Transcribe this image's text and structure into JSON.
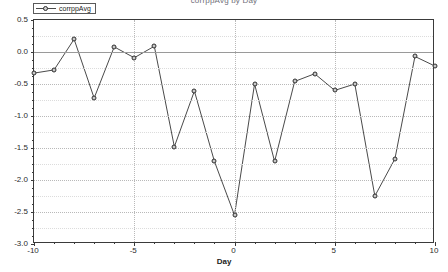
{
  "chart_data": {
    "type": "line",
    "title": "corrppAvg by Day",
    "xlabel": "Day",
    "ylabel": "",
    "xlim": [
      -10,
      10
    ],
    "ylim": [
      -3.0,
      0.5
    ],
    "xticks": [
      -10,
      -5,
      0,
      5,
      10
    ],
    "xtick_labels": [
      "-10",
      "-5",
      "0",
      "5",
      "10"
    ],
    "yticks": [
      0.5,
      0.0,
      -0.5,
      -1.0,
      -1.5,
      -2.0,
      -2.5,
      -3.0
    ],
    "ytick_labels": [
      "0.5",
      "0.0",
      "-0.5",
      "-1.0",
      "-1.5",
      "-2.0",
      "-2.5",
      "-3.0"
    ],
    "grid": true,
    "legend_position": "top-left",
    "series": [
      {
        "name": "corrppAvg",
        "marker": "circle",
        "x": [
          -10,
          -9,
          -8,
          -7,
          -6,
          -5,
          -4,
          -3,
          -2,
          -1,
          0,
          1,
          2,
          3,
          4,
          5,
          6,
          7,
          8,
          9,
          10
        ],
        "values": [
          -0.33,
          -0.28,
          0.2,
          -0.72,
          0.08,
          -0.09,
          0.09,
          -1.48,
          -0.61,
          -1.71,
          -2.55,
          -0.5,
          -1.71,
          -0.46,
          -0.34,
          -0.6,
          -0.5,
          -2.25,
          -1.67,
          -0.07,
          -0.22
        ]
      }
    ]
  },
  "legend": {
    "entries": [
      {
        "label": "corrppAvg"
      }
    ]
  },
  "axes": {
    "x_title": "Day"
  },
  "colors": {
    "line": "#4a4a4a",
    "marker_fill": "#c8c8c8",
    "marker_edge": "#2e2e2e",
    "grid": "#b9b9b9",
    "axis": "#3a3a3a",
    "zero_line": "#9a9a9a"
  }
}
